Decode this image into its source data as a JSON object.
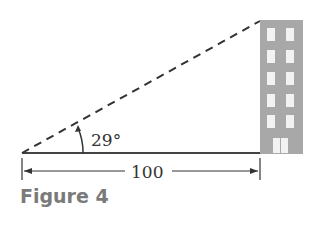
{
  "figure": {
    "caption": "Figure 4",
    "angle_label": "29°",
    "distance_label": "100",
    "colors": {
      "line": "#333333",
      "building": "#a8a8a8",
      "window": "#f2f2f2",
      "caption": "#7a7a7a"
    }
  }
}
